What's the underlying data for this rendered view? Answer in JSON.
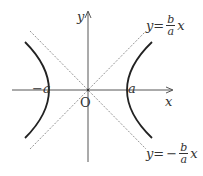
{
  "diagram": {
    "axes": {
      "x_label": "x",
      "y_label": "y",
      "origin_label": "O"
    },
    "vertices": {
      "left_label": "−a",
      "right_label": "a"
    },
    "asymptotes": {
      "positive": {
        "lhs": "y",
        "eq": "=",
        "sign": "",
        "numerator": "b",
        "denominator": "a",
        "var": "x"
      },
      "negative": {
        "lhs": "y",
        "eq": "=",
        "sign": "−",
        "numerator": "b",
        "denominator": "a",
        "var": "x"
      }
    },
    "colors": {
      "curve": "#222222",
      "axis": "#444444",
      "asymptote": "#777777",
      "text": "#333333"
    }
  }
}
